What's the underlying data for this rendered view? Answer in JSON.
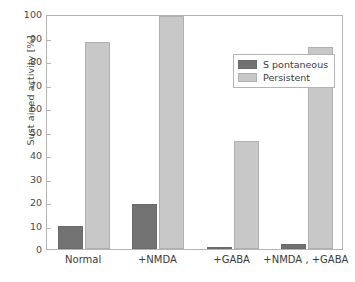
{
  "chart_data": {
    "type": "bar",
    "title": "",
    "xlabel": "",
    "ylabel": "Sust ained activity [%]",
    "categories": [
      "Normal",
      "+NMDA",
      "+GABA",
      "+NMDA , +GABA"
    ],
    "series": [
      {
        "name": "S pontaneous",
        "color": "#727272",
        "values": [
          10,
          19,
          1,
          2
        ]
      },
      {
        "name": "Persistent",
        "color": "#c8c8c8",
        "values": [
          88,
          99,
          46,
          86
        ]
      }
    ],
    "ylim": [
      0,
      100
    ],
    "yticks": [
      0,
      10,
      20,
      30,
      40,
      50,
      60,
      70,
      80,
      90,
      100
    ],
    "ytick_labels": [
      "0",
      "10",
      "20",
      "30",
      "40",
      "50",
      "60",
      "70",
      "80",
      "90",
      "100"
    ],
    "grid": false,
    "legend_position": "top-right-inside",
    "frame": true
  },
  "axes": {
    "y_title": "Sust ained activity [%]"
  },
  "legend": {
    "entries": [
      {
        "label": "S pontaneous",
        "swatch": "spontaneous"
      },
      {
        "label": "Persistent",
        "swatch": "persistent"
      }
    ]
  }
}
